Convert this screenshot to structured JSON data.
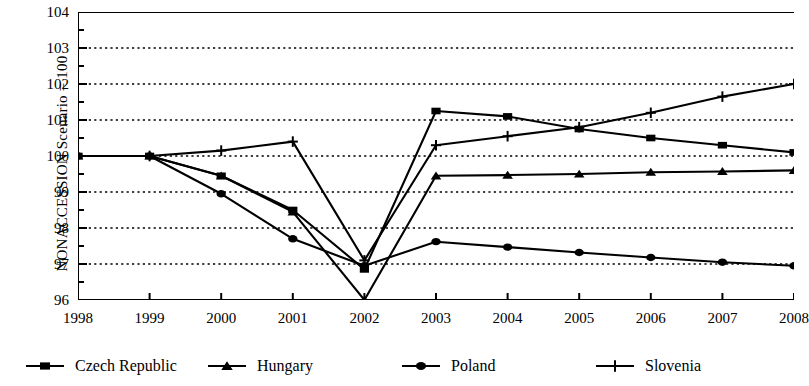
{
  "chart_data": {
    "type": "line",
    "title": "",
    "xlabel": "",
    "ylabel": "NONACCESSION Scenario = 100",
    "x": [
      1998,
      1999,
      2000,
      2001,
      2002,
      2003,
      2004,
      2005,
      2006,
      2007,
      2008
    ],
    "categories": [
      "1998",
      "1999",
      "2000",
      "2001",
      "2002",
      "2003",
      "2004",
      "2005",
      "2006",
      "2007",
      "2008"
    ],
    "xlim": [
      1998,
      2008
    ],
    "ylim": [
      96,
      104
    ],
    "yticks": [
      96,
      97,
      98,
      99,
      100,
      101,
      102,
      103,
      104
    ],
    "ytick_labels": [
      "96",
      "97",
      "98",
      "99",
      "100",
      "101",
      "102",
      "103",
      "104"
    ],
    "yminor_step": 0.5,
    "grid": "horizontal-dotted",
    "legend_position": "bottom",
    "series": [
      {
        "name": "Czech Republic",
        "marker": "square",
        "values": [
          100.0,
          100.0,
          99.45,
          98.5,
          96.85,
          101.25,
          101.1,
          100.75,
          100.5,
          100.3,
          100.1
        ]
      },
      {
        "name": "Hungary",
        "marker": "triangle",
        "values": [
          100.0,
          100.0,
          99.45,
          98.45,
          96.0,
          99.45,
          99.47,
          99.5,
          99.55,
          99.57,
          99.6
        ]
      },
      {
        "name": "Poland",
        "marker": "circle",
        "values": [
          100.0,
          100.0,
          98.95,
          97.7,
          96.95,
          97.62,
          97.47,
          97.32,
          97.18,
          97.05,
          96.95
        ]
      },
      {
        "name": "Slovenia",
        "marker": "plus",
        "values": [
          100.0,
          100.0,
          100.15,
          100.4,
          97.1,
          100.3,
          100.55,
          100.8,
          101.2,
          101.65,
          102.0
        ]
      }
    ]
  },
  "axis": {
    "y_title": "NONACCESSION Scenario = 100"
  },
  "legend": {
    "items": [
      {
        "label": "Czech Republic",
        "marker": "square"
      },
      {
        "label": "Hungary",
        "marker": "triangle"
      },
      {
        "label": "Poland",
        "marker": "circle"
      },
      {
        "label": "Slovenia",
        "marker": "plus"
      }
    ]
  },
  "colors": {
    "line": "#000000",
    "grid": "#000000",
    "background": "#ffffff"
  }
}
